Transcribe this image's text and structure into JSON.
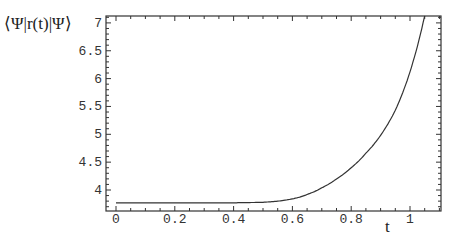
{
  "chart_data": {
    "type": "line",
    "title": "",
    "xlabel": "t",
    "ylabel": "⟨Ψ|r(t)|Ψ⟩",
    "xlim": [
      -0.02,
      1.1
    ],
    "ylim": [
      3.62,
      7.13
    ],
    "grid": false,
    "legend": null,
    "x_ticks": [
      0,
      0.2,
      0.4,
      0.6,
      0.8,
      1
    ],
    "x_tick_labels": [
      "0",
      "0.2",
      "0.4",
      "0.6",
      "0.8",
      "1"
    ],
    "y_ticks": [
      4,
      4.5,
      5,
      5.5,
      6,
      6.5,
      7
    ],
    "y_tick_labels": [
      "4",
      "4.5",
      "5",
      "5.5",
      "6",
      "6.5",
      "7"
    ],
    "series": [
      {
        "name": "<Psi|r(t)|Psi>",
        "x": [
          0,
          0.1,
          0.2,
          0.3,
          0.4,
          0.5,
          0.55,
          0.6,
          0.65,
          0.7,
          0.75,
          0.8,
          0.85,
          0.9,
          0.95,
          1.0,
          1.05
        ],
        "values": [
          3.77,
          3.77,
          3.77,
          3.77,
          3.77,
          3.78,
          3.8,
          3.84,
          3.92,
          4.04,
          4.2,
          4.4,
          4.66,
          4.98,
          5.43,
          6.12,
          7.13
        ]
      }
    ]
  },
  "labels": {
    "ylabel": "⟨Ψ|r(t)|Ψ⟩",
    "xlabel": "t"
  }
}
